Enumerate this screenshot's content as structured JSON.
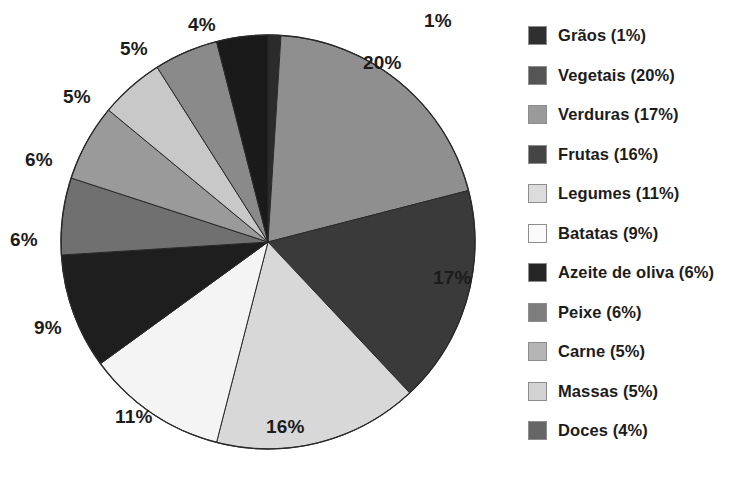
{
  "chart_data": {
    "type": "pie",
    "title": "",
    "legend_position": "right",
    "start_angle_deg": 0,
    "direction": "clockwise",
    "unit": "%",
    "categories": [
      "Grãos",
      "Vegetais",
      "Verduras",
      "Frutas",
      "Legumes",
      "Batatas",
      "Azeite de oliva",
      "Peixe",
      "Carne",
      "Massas",
      "Doces"
    ],
    "values": [
      1,
      20,
      17,
      16,
      11,
      9,
      6,
      6,
      5,
      5,
      4
    ],
    "colors": [
      "#2b2b2b",
      "#8f8f8f",
      "#3a3a3a",
      "#d8d8d8",
      "#f4f4f4",
      "#1e1e1e",
      "#707070",
      "#9a9a9a",
      "#c8c8c8",
      "#8a8a8a",
      "#1a1a1a"
    ],
    "legend_colors": [
      "#2f2f2f",
      "#555555",
      "#9a9a9a",
      "#454545",
      "#dcdcdc",
      "#fafafa",
      "#262626",
      "#7d7d7d",
      "#b4b4b4",
      "#d2d2d2",
      "#666666"
    ],
    "slice_labels": [
      "1%",
      "20%",
      "17%",
      "16%",
      "11%",
      "9%",
      "6%",
      "6%",
      "5%",
      "5%",
      "4%"
    ],
    "legend_entries": [
      {
        "label": "Grãos (1%)",
        "name": "Grãos",
        "value": 1
      },
      {
        "label": "Vegetais (20%)",
        "name": "Vegetais",
        "value": 20
      },
      {
        "label": "Verduras (17%)",
        "name": "Verduras",
        "value": 17
      },
      {
        "label": "Frutas (16%)",
        "name": "Frutas",
        "value": 16
      },
      {
        "label": "Legumes (11%)",
        "name": "Legumes",
        "value": 11
      },
      {
        "label": "Batatas (9%)",
        "name": "Batatas",
        "value": 9
      },
      {
        "label": "Azeite de oliva (6%)",
        "name": "Azeite de oliva",
        "value": 6
      },
      {
        "label": "Peixe (6%)",
        "name": "Peixe",
        "value": 6
      },
      {
        "label": "Carne (5%)",
        "name": "Carne",
        "value": 5
      },
      {
        "label": "Massas (5%)",
        "name": "Massas",
        "value": 5
      },
      {
        "label": "Doces (4%)",
        "name": "Doces",
        "value": 4
      }
    ]
  },
  "callouts": [
    {
      "text": "1%",
      "x": 424,
      "y": 10
    },
    {
      "text": "20%",
      "x": 363,
      "y": 52
    },
    {
      "text": "17%",
      "x": 433,
      "y": 267
    },
    {
      "text": "16%",
      "x": 266,
      "y": 416
    },
    {
      "text": "11%",
      "x": 115,
      "y": 406
    },
    {
      "text": "9%",
      "x": 34,
      "y": 317
    },
    {
      "text": "6%",
      "x": 10,
      "y": 229
    },
    {
      "text": "6%",
      "x": 25,
      "y": 149
    },
    {
      "text": "5%",
      "x": 63,
      "y": 86
    },
    {
      "text": "5%",
      "x": 120,
      "y": 38
    },
    {
      "text": "4%",
      "x": 188,
      "y": 14
    }
  ]
}
